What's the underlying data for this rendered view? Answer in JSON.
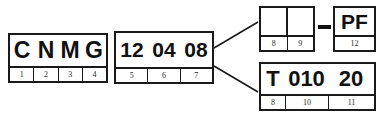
{
  "diagram": {
    "background_color": "#ffffff",
    "line_color": "#1a1a1a",
    "text_color": "#111111"
  },
  "blocks": {
    "designation": {
      "name": "designation-block",
      "cells": [
        "C",
        "N",
        "M",
        "G"
      ],
      "labels": [
        "1",
        "2",
        "3",
        "4"
      ]
    },
    "dimensions": {
      "name": "dimensions-block",
      "cells": [
        "12",
        "04",
        "08"
      ],
      "labels": [
        "5",
        "6",
        "7"
      ]
    },
    "blank": {
      "name": "blank-block",
      "cells": [
        "",
        ""
      ],
      "labels": [
        "8",
        "9"
      ]
    },
    "tolerance": {
      "name": "tolerance-block",
      "cells": [
        "PF"
      ],
      "labels": [
        "12"
      ]
    },
    "chipbreaker": {
      "name": "chipbreaker-block",
      "cells": [
        "T",
        "010",
        "20"
      ],
      "labels": [
        "8",
        "10",
        "11"
      ]
    }
  },
  "separator": {
    "dash": "-"
  },
  "connectors": {
    "origin_x": 214,
    "origin_upper_y": 48,
    "origin_lower_y": 66,
    "upper_end_x": 258,
    "upper_end_y": 22,
    "lower_end_x": 258,
    "lower_end_y": 92
  }
}
